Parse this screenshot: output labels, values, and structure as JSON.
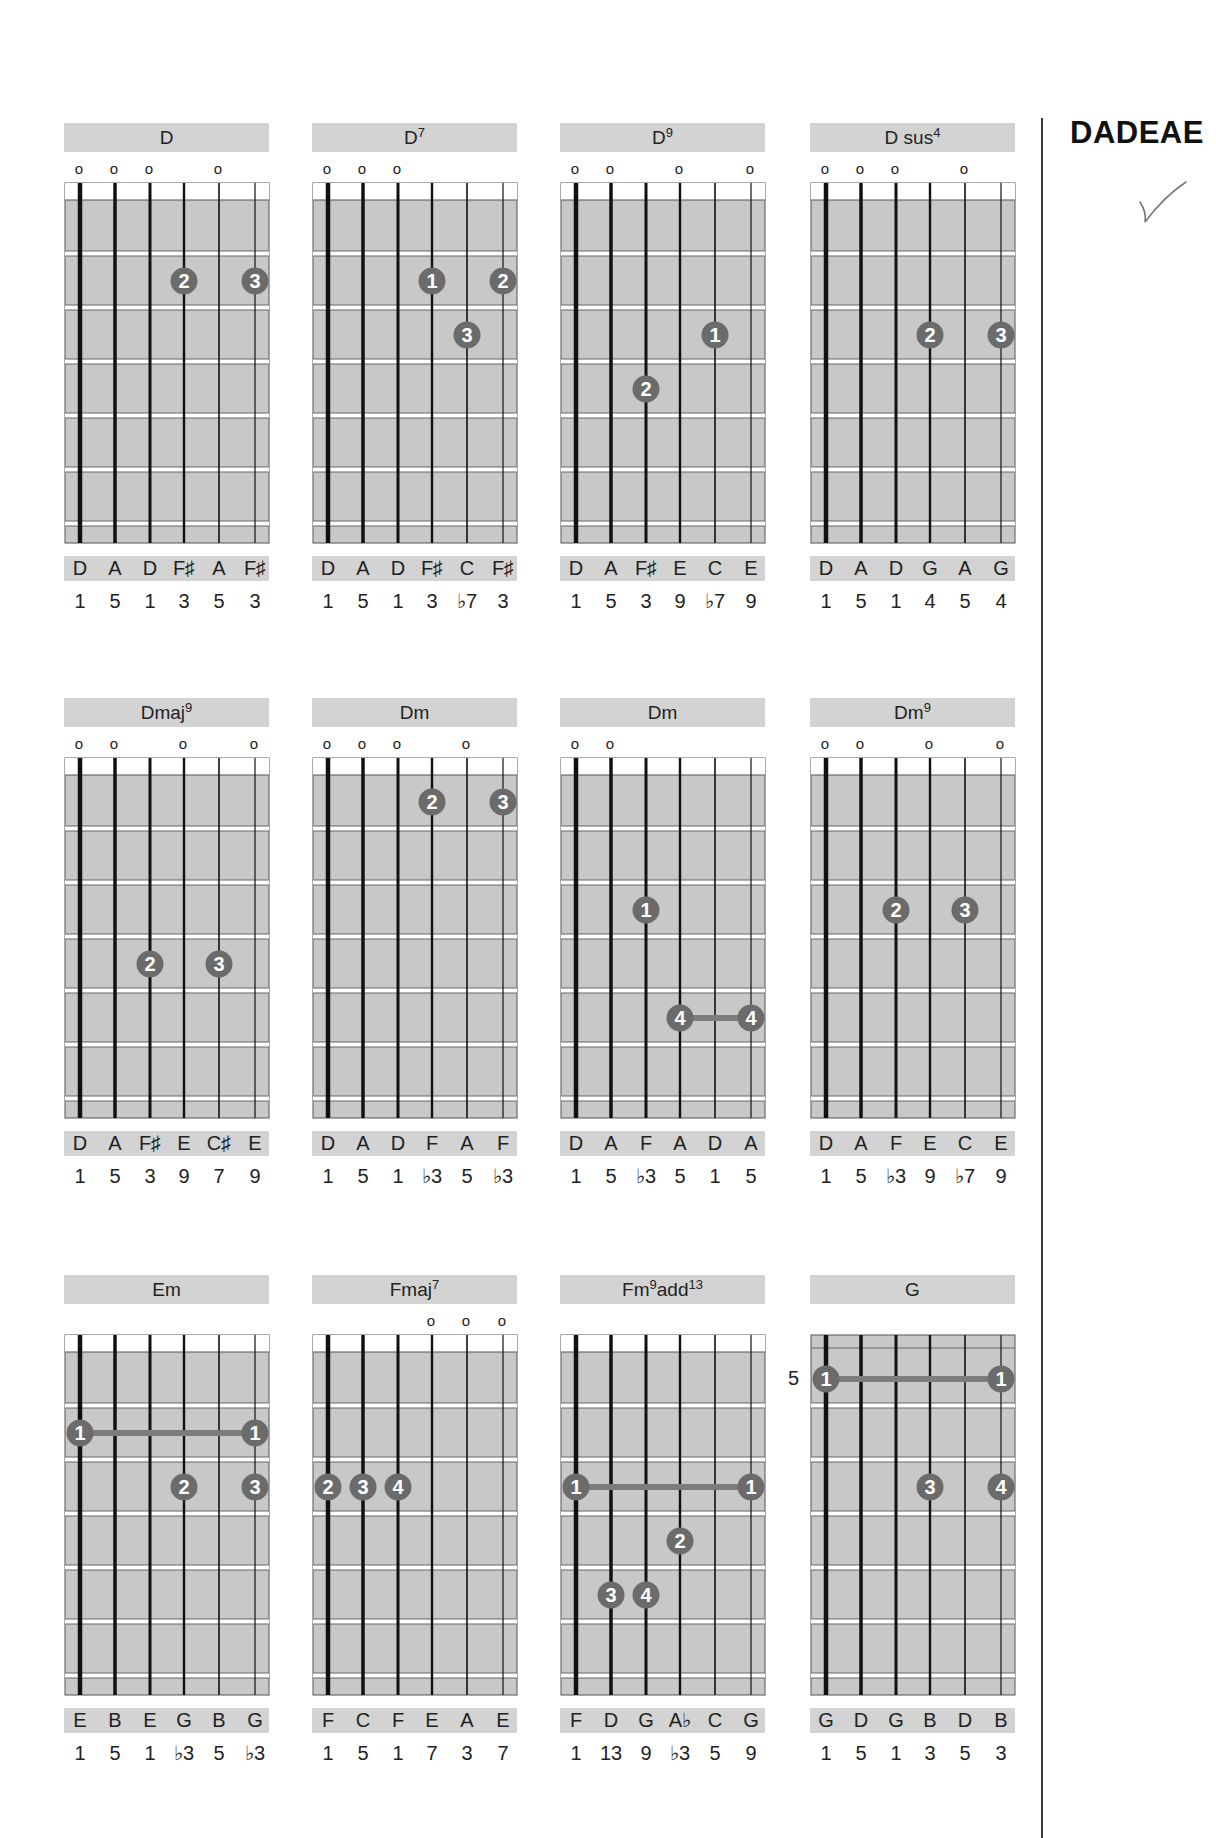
{
  "tuning_heading": "DADEAE",
  "check_mark": "✓",
  "colors": {
    "panel_gray": "#d3d3d3",
    "fretboard_gray": "#c8c8c8",
    "finger_dot": "#6b6b6b",
    "barre": "#7c7c7c",
    "string": "#111111"
  },
  "grid": {
    "width": 204,
    "height": 360,
    "nut_band": 17,
    "fret_spacing": 54,
    "frets": 6,
    "string_x": [
      15,
      50,
      85,
      119,
      154,
      190
    ]
  },
  "rows_top": [
    123,
    698,
    1275
  ],
  "cols_left": [
    64,
    312,
    560,
    810
  ],
  "chords": [
    {
      "name": "D",
      "sup": "",
      "suffix": "",
      "open_strings": [
        1,
        2,
        3,
        5
      ],
      "nut": true,
      "fret_label": "",
      "fingers": [
        {
          "string": 4,
          "fret": 2,
          "finger": "2"
        },
        {
          "string": 6,
          "fret": 2,
          "finger": "3"
        }
      ],
      "barres": [],
      "notes": [
        "D",
        "A",
        "D",
        "F♯",
        "A",
        "F♯"
      ],
      "degrees": [
        "1",
        "5",
        "1",
        "3",
        "5",
        "3"
      ]
    },
    {
      "name": "D",
      "sup": "7",
      "suffix": "",
      "open_strings": [
        1,
        2,
        3
      ],
      "nut": true,
      "fret_label": "",
      "fingers": [
        {
          "string": 4,
          "fret": 2,
          "finger": "1"
        },
        {
          "string": 6,
          "fret": 2,
          "finger": "2"
        },
        {
          "string": 5,
          "fret": 3,
          "finger": "3"
        }
      ],
      "barres": [],
      "notes": [
        "D",
        "A",
        "D",
        "F♯",
        "C",
        "F♯"
      ],
      "degrees": [
        "1",
        "5",
        "1",
        "3",
        "♭7",
        "3"
      ]
    },
    {
      "name": "D",
      "sup": "9",
      "suffix": "",
      "open_strings": [
        1,
        2,
        4,
        6
      ],
      "nut": true,
      "fret_label": "",
      "fingers": [
        {
          "string": 5,
          "fret": 3,
          "finger": "1"
        },
        {
          "string": 3,
          "fret": 4,
          "finger": "2"
        }
      ],
      "barres": [],
      "notes": [
        "D",
        "A",
        "F♯",
        "E",
        "C",
        "E"
      ],
      "degrees": [
        "1",
        "5",
        "3",
        "9",
        "♭7",
        "9"
      ]
    },
    {
      "name": "D sus",
      "sup": "4",
      "suffix": "",
      "open_strings": [
        1,
        2,
        3,
        5
      ],
      "nut": true,
      "fret_label": "",
      "fingers": [
        {
          "string": 4,
          "fret": 3,
          "finger": "2"
        },
        {
          "string": 6,
          "fret": 3,
          "finger": "3"
        }
      ],
      "barres": [],
      "notes": [
        "D",
        "A",
        "D",
        "G",
        "A",
        "G"
      ],
      "degrees": [
        "1",
        "5",
        "1",
        "4",
        "5",
        "4"
      ]
    },
    {
      "name": "Dmaj",
      "sup": "9",
      "suffix": "",
      "open_strings": [
        1,
        2,
        4,
        6
      ],
      "nut": true,
      "fret_label": "",
      "fingers": [
        {
          "string": 3,
          "fret": 4,
          "finger": "2"
        },
        {
          "string": 5,
          "fret": 4,
          "finger": "3"
        }
      ],
      "barres": [],
      "notes": [
        "D",
        "A",
        "F♯",
        "E",
        "C♯",
        "E"
      ],
      "degrees": [
        "1",
        "5",
        "3",
        "9",
        "7",
        "9"
      ]
    },
    {
      "name": "Dm",
      "sup": "",
      "suffix": "",
      "open_strings": [
        1,
        2,
        3,
        5
      ],
      "nut": true,
      "fret_label": "",
      "fingers": [
        {
          "string": 4,
          "fret": 1,
          "finger": "2"
        },
        {
          "string": 6,
          "fret": 1,
          "finger": "3"
        }
      ],
      "barres": [],
      "notes": [
        "D",
        "A",
        "D",
        "F",
        "A",
        "F"
      ],
      "degrees": [
        "1",
        "5",
        "1",
        "♭3",
        "5",
        "♭3"
      ]
    },
    {
      "name": "Dm",
      "sup": "",
      "suffix": "",
      "open_strings": [
        1,
        2
      ],
      "nut": true,
      "fret_label": "",
      "fingers": [
        {
          "string": 3,
          "fret": 3,
          "finger": "1"
        },
        {
          "string": 4,
          "fret": 5,
          "finger": "4"
        },
        {
          "string": 6,
          "fret": 5,
          "finger": "4"
        }
      ],
      "barres": [
        {
          "from": 4,
          "to": 6,
          "fret": 5
        }
      ],
      "notes": [
        "D",
        "A",
        "F",
        "A",
        "D",
        "A"
      ],
      "degrees": [
        "1",
        "5",
        "♭3",
        "5",
        "1",
        "5"
      ]
    },
    {
      "name": "Dm",
      "sup": "9",
      "suffix": "",
      "open_strings": [
        1,
        2,
        4,
        6
      ],
      "nut": true,
      "fret_label": "",
      "fingers": [
        {
          "string": 3,
          "fret": 3,
          "finger": "2"
        },
        {
          "string": 5,
          "fret": 3,
          "finger": "3"
        }
      ],
      "barres": [],
      "notes": [
        "D",
        "A",
        "F",
        "E",
        "C",
        "E"
      ],
      "degrees": [
        "1",
        "5",
        "♭3",
        "9",
        "♭7",
        "9"
      ]
    },
    {
      "name": "Em",
      "sup": "",
      "suffix": "",
      "open_strings": [],
      "nut": true,
      "fret_label": "",
      "fingers": [
        {
          "string": 1,
          "fret": 2,
          "finger": "1"
        },
        {
          "string": 6,
          "fret": 2,
          "finger": "1"
        },
        {
          "string": 4,
          "fret": 3,
          "finger": "2"
        },
        {
          "string": 6,
          "fret": 3,
          "finger": "3"
        }
      ],
      "barres": [
        {
          "from": 1,
          "to": 6,
          "fret": 2
        }
      ],
      "notes": [
        "E",
        "B",
        "E",
        "G",
        "B",
        "G"
      ],
      "degrees": [
        "1",
        "5",
        "1",
        "♭3",
        "5",
        "♭3"
      ]
    },
    {
      "name": "Fmaj",
      "sup": "7",
      "suffix": "",
      "open_strings": [
        4,
        5,
        6
      ],
      "nut": true,
      "fret_label": "",
      "fingers": [
        {
          "string": 1,
          "fret": 3,
          "finger": "2"
        },
        {
          "string": 2,
          "fret": 3,
          "finger": "3"
        },
        {
          "string": 3,
          "fret": 3,
          "finger": "4"
        }
      ],
      "barres": [],
      "notes": [
        "F",
        "C",
        "F",
        "E",
        "A",
        "E"
      ],
      "degrees": [
        "1",
        "5",
        "1",
        "7",
        "3",
        "7"
      ]
    },
    {
      "name": "Fm",
      "sup": "9",
      "suffix": "add",
      "suffix_sup": "13",
      "open_strings": [],
      "nut": true,
      "fret_label": "",
      "fingers": [
        {
          "string": 1,
          "fret": 3,
          "finger": "1"
        },
        {
          "string": 6,
          "fret": 3,
          "finger": "1"
        },
        {
          "string": 4,
          "fret": 4,
          "finger": "2"
        },
        {
          "string": 2,
          "fret": 5,
          "finger": "3"
        },
        {
          "string": 3,
          "fret": 5,
          "finger": "4"
        }
      ],
      "barres": [
        {
          "from": 1,
          "to": 6,
          "fret": 3
        }
      ],
      "notes": [
        "F",
        "D",
        "G",
        "A♭",
        "C",
        "G"
      ],
      "degrees": [
        "1",
        "13",
        "9",
        "♭3",
        "5",
        "9"
      ]
    },
    {
      "name": "G",
      "sup": "",
      "suffix": "",
      "open_strings": [],
      "nut": false,
      "fret_label": "5",
      "fingers": [
        {
          "string": 1,
          "fret": 1,
          "finger": "1"
        },
        {
          "string": 6,
          "fret": 1,
          "finger": "1"
        },
        {
          "string": 4,
          "fret": 3,
          "finger": "3"
        },
        {
          "string": 6,
          "fret": 3,
          "finger": "4"
        }
      ],
      "barres": [
        {
          "from": 1,
          "to": 6,
          "fret": 1
        }
      ],
      "notes": [
        "G",
        "D",
        "G",
        "B",
        "D",
        "B"
      ],
      "degrees": [
        "1",
        "5",
        "1",
        "3",
        "5",
        "3"
      ]
    }
  ]
}
